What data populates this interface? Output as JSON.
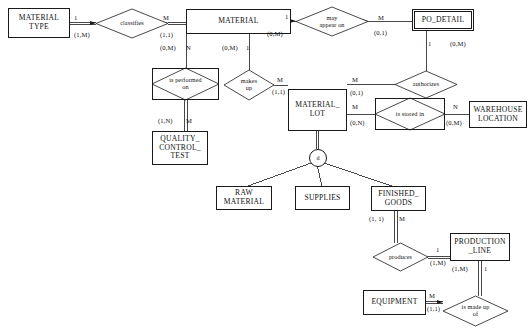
{
  "diagram": {
    "notation": "Chen ERD with (min,max) participation and 1/M/N connectivity",
    "line_color": "#1a1a1a",
    "background_color": "#ffffff"
  },
  "entities": [
    {
      "id": "material_type",
      "label": "MATERIAL\nTYPE",
      "kind": "strong",
      "x": 8,
      "y": 8,
      "w": 62,
      "h": 30
    },
    {
      "id": "material",
      "label": "MATERIAL",
      "kind": "strong",
      "x": 186,
      "y": 9,
      "w": 105,
      "h": 25
    },
    {
      "id": "po_detail",
      "label": "PO_DETAIL",
      "kind": "weak",
      "x": 412,
      "y": 9,
      "w": 62,
      "h": 22
    },
    {
      "id": "quality_control_test",
      "label": "QUALITY_\nCONTROL_\nTEST",
      "kind": "strong",
      "x": 152,
      "y": 131,
      "w": 56,
      "h": 34
    },
    {
      "id": "material_lot",
      "label": "MATERIAL_\nLOT",
      "kind": "strong",
      "x": 288,
      "y": 89,
      "w": 59,
      "h": 42
    },
    {
      "id": "warehouse_location",
      "label": "WAREHOUSE\nLOCATION",
      "kind": "strong",
      "x": 469,
      "y": 101,
      "w": 58,
      "h": 27
    },
    {
      "id": "raw_material",
      "label": "RAW\nMATERIAL",
      "kind": "strong",
      "x": 216,
      "y": 186,
      "w": 56,
      "h": 24
    },
    {
      "id": "supplies",
      "label": "SUPPLIES",
      "kind": "strong",
      "x": 295,
      "y": 186,
      "w": 55,
      "h": 24
    },
    {
      "id": "finished_goods",
      "label": "FINISHED_\nGOODS",
      "kind": "strong",
      "x": 371,
      "y": 186,
      "w": 55,
      "h": 25
    },
    {
      "id": "production_line",
      "label": "PRODUCTION\n_LINE",
      "kind": "strong",
      "x": 450,
      "y": 233,
      "w": 60,
      "h": 28
    },
    {
      "id": "equipment",
      "label": "EQUIPMENT",
      "kind": "strong",
      "x": 363,
      "y": 290,
      "w": 63,
      "h": 25
    }
  ],
  "relationships": [
    {
      "id": "classifies",
      "label": "classifies",
      "kind": "regular",
      "x": 96,
      "y": 9,
      "w": 72,
      "h": 29
    },
    {
      "id": "may_appear_on",
      "label": "may\nappear on",
      "kind": "regular",
      "x": 296,
      "y": 7,
      "w": 72,
      "h": 29
    },
    {
      "id": "is_performed_on",
      "label": "is performed\non",
      "kind": "identifying",
      "x": 152,
      "y": 68,
      "w": 67,
      "h": 32
    },
    {
      "id": "makes_up",
      "label": "makes\nup",
      "kind": "regular",
      "x": 224,
      "y": 70,
      "w": 50,
      "h": 30
    },
    {
      "id": "authorizes",
      "label": "authorizes",
      "kind": "regular",
      "x": 395,
      "y": 71,
      "w": 62,
      "h": 27
    },
    {
      "id": "is_stored_in",
      "label": "is stored in",
      "kind": "identifying",
      "x": 375,
      "y": 98,
      "w": 70,
      "h": 32
    },
    {
      "id": "produces",
      "label": "produces",
      "kind": "regular",
      "x": 373,
      "y": 243,
      "w": 55,
      "h": 28
    },
    {
      "id": "is_made_up_of",
      "label": "is made up\nof",
      "kind": "regular",
      "x": 443,
      "y": 296,
      "w": 65,
      "h": 30
    }
  ],
  "specialization": {
    "id": "material_lot_disjoint",
    "symbol": "d",
    "type": "disjoint",
    "x": 309,
    "y": 149
  },
  "cardinality_labels": [
    {
      "id": "mt-classifies-conn",
      "text": "1",
      "x": 74,
      "y": 14
    },
    {
      "id": "mt-classifies-part",
      "text": "(1,M)",
      "x": 74,
      "y": 31
    },
    {
      "id": "classifies-mat-conn",
      "text": "M",
      "x": 163,
      "y": 14
    },
    {
      "id": "classifies-mat-part",
      "text": "(1,1)",
      "x": 160,
      "y": 31
    },
    {
      "id": "mat-perf-part",
      "text": "(0,M)",
      "x": 160,
      "y": 44
    },
    {
      "id": "mat-perf-conn",
      "text": "N",
      "x": 186,
      "y": 44
    },
    {
      "id": "mat-makes-part",
      "text": "(0,M)",
      "x": 222,
      "y": 44
    },
    {
      "id": "mat-makes-conn",
      "text": "1",
      "x": 246,
      "y": 44
    },
    {
      "id": "mat-appear-conn",
      "text": "1",
      "x": 285,
      "y": 13
    },
    {
      "id": "mat-appear-part",
      "text": "(0,M)",
      "x": 267,
      "y": 30
    },
    {
      "id": "appear-po-conn",
      "text": "M",
      "x": 378,
      "y": 14
    },
    {
      "id": "appear-po-part",
      "text": "(0,1)",
      "x": 374,
      "y": 29
    },
    {
      "id": "po-auth-conn",
      "text": "1",
      "x": 428,
      "y": 40
    },
    {
      "id": "po-auth-part",
      "text": "(0,M)",
      "x": 450,
      "y": 40
    },
    {
      "id": "perf-qct-part",
      "text": "(1,N)",
      "x": 158,
      "y": 117
    },
    {
      "id": "perf-qct-conn",
      "text": "M",
      "x": 186,
      "y": 117
    },
    {
      "id": "makes-lot-conn",
      "text": "M",
      "x": 277,
      "y": 82
    },
    {
      "id": "makes-lot-part",
      "text": "(1,1)",
      "x": 272,
      "y": 93
    },
    {
      "id": "lot-auth-conn",
      "text": "M",
      "x": 352,
      "y": 80
    },
    {
      "id": "lot-auth-part",
      "text": "(0,1)",
      "x": 350,
      "y": 93
    },
    {
      "id": "lot-stored-conn",
      "text": "M",
      "x": 352,
      "y": 105
    },
    {
      "id": "lot-stored-part",
      "text": "(0,N)",
      "x": 350,
      "y": 120
    },
    {
      "id": "stored-wh-conn",
      "text": "N",
      "x": 453,
      "y": 105
    },
    {
      "id": "stored-wh-part",
      "text": "(0,M)",
      "x": 446,
      "y": 120
    },
    {
      "id": "fg-produces-part",
      "text": "(1, 1)",
      "x": 369,
      "y": 217
    },
    {
      "id": "fg-produces-conn",
      "text": "M",
      "x": 398,
      "y": 217
    },
    {
      "id": "produces-pl-conn",
      "text": "1",
      "x": 436,
      "y": 243
    },
    {
      "id": "produces-pl-part",
      "text": "(1,M)",
      "x": 430,
      "y": 257
    },
    {
      "id": "pl-made-part",
      "text": "(1,M)",
      "x": 455,
      "y": 266
    },
    {
      "id": "pl-made-conn",
      "text": "1",
      "x": 484,
      "y": 266
    },
    {
      "id": "eq-made-conn",
      "text": "M",
      "x": 430,
      "y": 294
    },
    {
      "id": "eq-made-part",
      "text": "(1,1)",
      "x": 428,
      "y": 307
    }
  ],
  "connectors": [
    {
      "id": "material_type-classifies",
      "from": "MATERIAL TYPE",
      "to": "classifies",
      "style": "double"
    },
    {
      "id": "classifies-material",
      "from": "classifies",
      "to": "MATERIAL",
      "style": "double"
    },
    {
      "id": "material-may_appear_on",
      "from": "MATERIAL",
      "to": "may appear on",
      "style": "single"
    },
    {
      "id": "may_appear_on-po_detail",
      "from": "may appear on",
      "to": "PO_DETAIL",
      "style": "single"
    },
    {
      "id": "material-is_performed_on",
      "from": "MATERIAL",
      "to": "is performed on",
      "style": "single"
    },
    {
      "id": "is_performed_on-qct",
      "from": "is performed on",
      "to": "QUALITY CONTROL TEST",
      "style": "double"
    },
    {
      "id": "material-makes_up",
      "from": "MATERIAL",
      "to": "makes up",
      "style": "single"
    },
    {
      "id": "makes_up-material_lot",
      "from": "makes up",
      "to": "MATERIAL_LOT",
      "style": "single"
    },
    {
      "id": "po_detail-authorizes",
      "from": "PO_DETAIL",
      "to": "authorizes",
      "style": "single"
    },
    {
      "id": "authorizes-material_lot",
      "from": "authorizes",
      "to": "MATERIAL_LOT",
      "style": "single"
    },
    {
      "id": "material_lot-is_stored_in",
      "from": "MATERIAL_LOT",
      "to": "is stored in",
      "style": "single"
    },
    {
      "id": "is_stored_in-warehouse",
      "from": "is stored in",
      "to": "WAREHOUSE LOCATION",
      "style": "single"
    },
    {
      "id": "material_lot-disjoint",
      "from": "MATERIAL_LOT",
      "to": "d",
      "style": "double"
    },
    {
      "id": "disjoint-raw_material",
      "from": "d",
      "to": "RAW MATERIAL",
      "style": "single"
    },
    {
      "id": "disjoint-supplies",
      "from": "d",
      "to": "SUPPLIES",
      "style": "single"
    },
    {
      "id": "disjoint-finished_goods",
      "from": "d",
      "to": "FINISHED_GOODS",
      "style": "single"
    },
    {
      "id": "finished_goods-produces",
      "from": "FINISHED_GOODS",
      "to": "produces",
      "style": "double"
    },
    {
      "id": "produces-production_line",
      "from": "produces",
      "to": "PRODUCTION_LINE",
      "style": "double"
    },
    {
      "id": "production_line-is_made_up",
      "from": "PRODUCTION_LINE",
      "to": "is made up of",
      "style": "double"
    },
    {
      "id": "equipment-is_made_up",
      "from": "EQUIPMENT",
      "to": "is made up of",
      "style": "double"
    }
  ]
}
